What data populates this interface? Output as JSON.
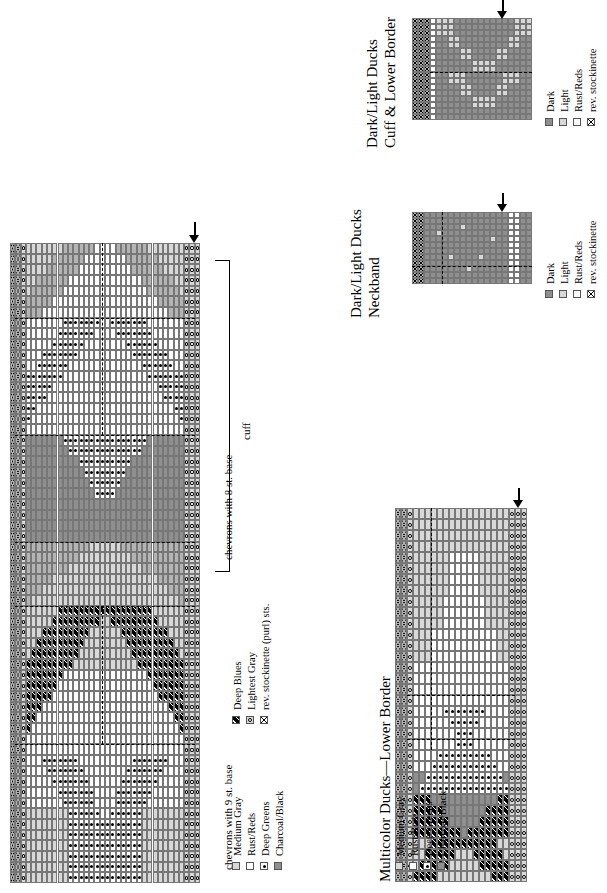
{
  "page": {
    "kind": "knitting-pattern-charts",
    "background": "#ffffff",
    "width": 607,
    "height": 893
  },
  "charts": [
    {
      "id": "multicolor-chevrons",
      "title": "",
      "section_labels": [
        {
          "text": "chevrons with 8 st. base"
        },
        {
          "text": "cuff"
        },
        {
          "text": "chevrons with 9 st. base"
        }
      ],
      "arrow_label": "start-of-round-arrow",
      "columns": 36,
      "rows": 60
    },
    {
      "id": "dark-light-ducks-cuff-lower-border",
      "title_line1": "Dark/Light Ducks",
      "title_line2": "Cuff & Lower Border",
      "arrow_label": "start-of-round-arrow",
      "columns": 20,
      "rows": 17
    },
    {
      "id": "dark-light-ducks-neckband",
      "title_line1": "Dark/Light Ducks",
      "title_line2": "Neckband",
      "arrow_label": "start-of-round-arrow",
      "columns": 20,
      "rows": 12
    },
    {
      "id": "multicolor-ducks-lower-border",
      "title": "Multicolor Ducks—Lower Border",
      "arrow_label": "start-of-round-arrow",
      "columns": 22,
      "rows": 34
    }
  ],
  "legends": [
    {
      "id": "multicolor-chevrons-legend",
      "columns": [
        {
          "entries": [
            {
              "label": "Medium Gray",
              "swatch": "medium-gray",
              "symbol": "none",
              "color": "#d8d8d8"
            },
            {
              "label": "Rust/Reds",
              "swatch": "white",
              "symbol": "none",
              "color": "#ffffff"
            },
            {
              "label": "Deep Greens",
              "swatch": "white-dot",
              "symbol": "dot",
              "color": "#ffffff"
            },
            {
              "label": "Charcoal/Black",
              "swatch": "charcoal",
              "symbol": "none",
              "color": "#8f8f8f"
            }
          ]
        },
        {
          "entries": [
            {
              "label": "Deep Blues",
              "swatch": "black-hatch",
              "symbol": "hatch",
              "color": "#000000"
            },
            {
              "label": "Lightest Gray",
              "swatch": "light-circle",
              "symbol": "circle",
              "color": "#d8d8d8"
            },
            {
              "label": "rev. stockinette (purl) sts.",
              "swatch": "x-mark",
              "symbol": "x",
              "color": "#ffffff"
            }
          ]
        }
      ]
    },
    {
      "id": "dark-light-ducks-cuff-legend",
      "entries": [
        {
          "label": "Dark",
          "swatch": "dark",
          "symbol": "none",
          "color": "#8f8f8f"
        },
        {
          "label": "Light",
          "swatch": "light",
          "symbol": "none",
          "color": "#d8d8d8"
        },
        {
          "label": "Rust/Reds",
          "swatch": "white",
          "symbol": "none",
          "color": "#ffffff"
        },
        {
          "label": "rev. stockinette",
          "swatch": "x-mark",
          "symbol": "x",
          "color": "#ffffff"
        }
      ]
    },
    {
      "id": "dark-light-ducks-neckband-legend",
      "entries": [
        {
          "label": "Dark",
          "swatch": "dark",
          "symbol": "none",
          "color": "#8f8f8f"
        },
        {
          "label": "Light",
          "swatch": "light",
          "symbol": "none",
          "color": "#d8d8d8"
        },
        {
          "label": "Rust/Reds",
          "swatch": "white",
          "symbol": "none",
          "color": "#ffffff"
        },
        {
          "label": "rev. stockinette",
          "swatch": "x-mark",
          "symbol": "x",
          "color": "#ffffff"
        }
      ]
    },
    {
      "id": "multicolor-ducks-legend",
      "entries": [
        {
          "label": "Medium Gray",
          "swatch": "medium-gray",
          "symbol": "none",
          "color": "#d8d8d8"
        },
        {
          "label": "Rust/Reds",
          "swatch": "white",
          "symbol": "none",
          "color": "#ffffff"
        },
        {
          "label": "Deep Greens",
          "swatch": "white-dot",
          "symbol": "dot",
          "color": "#ffffff"
        },
        {
          "label": "Charcoal/Black",
          "swatch": "charcoal",
          "symbol": "none",
          "color": "#8f8f8f"
        }
      ]
    }
  ],
  "palette": {
    "white": "#ffffff",
    "lightest_gray": "#d8d8d8",
    "medium_gray": "#b4b4b4",
    "dark_gray": "#8f8f8f",
    "charcoal": "#7a7a7a",
    "black": "#000000",
    "grid_line": "#777777"
  }
}
